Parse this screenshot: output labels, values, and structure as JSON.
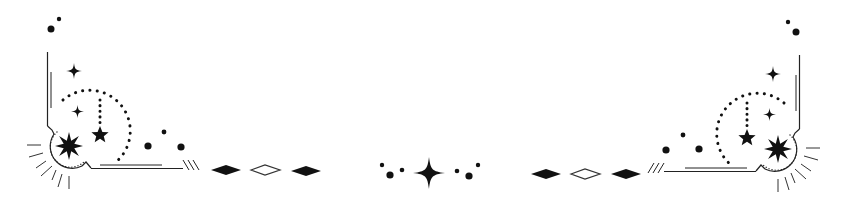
{
  "ornament": {
    "description": "Celestial star divider ornament",
    "ink_color": "#111111",
    "background_color": "#ffffff",
    "elements": {
      "left_corner": "dotted arc moon with stars and sunburst corner frame",
      "center": "four-point star flanked by dots and diamonds",
      "right_corner": "mirrored dotted arc moon with stars and sunburst corner frame"
    },
    "center_diamonds_left": [
      "filled",
      "outline",
      "filled"
    ],
    "center_diamonds_right": [
      "filled",
      "outline",
      "filled"
    ]
  }
}
